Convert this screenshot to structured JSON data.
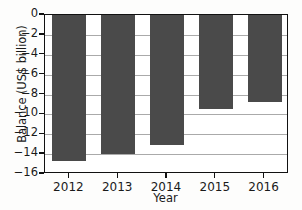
{
  "chart_data": {
    "type": "bar",
    "title": "",
    "subtitle": "",
    "xlabel": "Year",
    "ylabel": "Balance (US$ billion)",
    "categories": [
      "2012",
      "2013",
      "2014",
      "2015",
      "2016"
    ],
    "values": [
      -14.7,
      -14.0,
      -13.1,
      -9.5,
      -8.8
    ],
    "series": [
      {
        "name": "Balance",
        "values": [
          -14.7,
          -14.0,
          -13.1,
          -9.5,
          -8.8
        ]
      }
    ],
    "ylim": [
      -16,
      0
    ],
    "xlim_categories": 5,
    "ytick_labels": [
      "0",
      "-2",
      "-4",
      "-6",
      "-8",
      "-10",
      "-12",
      "-14",
      "-16"
    ],
    "ytick_values": [
      0,
      -2,
      -4,
      -6,
      -8,
      -10,
      -12,
      -14,
      -16
    ],
    "xtick_labels": [
      "2012",
      "2013",
      "2014",
      "2015",
      "2016"
    ],
    "grid": true,
    "grid_axis": "y",
    "legend": false,
    "legend_position": "none",
    "bar_color": "#4a4a4a",
    "grid_color": "#8d8d8d",
    "axis_color": "#111111",
    "background_color": "#ffffff",
    "annotations": []
  },
  "axes": {
    "y_title": "Balance (US$ billion)",
    "x_title": "Year"
  }
}
